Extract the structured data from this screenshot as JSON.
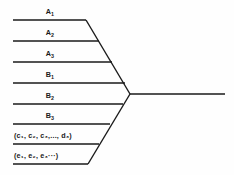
{
  "diagram": {
    "type": "fishbone-convergence",
    "background_color": "#fefefe",
    "line_color": "#1a1a1a",
    "text_color": "#1a1a1a",
    "spine": {
      "vertex_x": 130,
      "vertex_y": 94,
      "end_x": 225,
      "end_y": 94
    },
    "branches": [
      {
        "id": "a1",
        "label": "A",
        "subscript": "1",
        "full_text": "A₁",
        "line_y": 20,
        "line_x_start": 13,
        "line_x_end": 86,
        "label_x": 50,
        "label_y": 8,
        "group": "upper",
        "align": "centered"
      },
      {
        "id": "a2",
        "label": "A",
        "subscript": "2",
        "full_text": "A₂",
        "line_y": 41,
        "line_x_start": 13,
        "line_x_end": 99,
        "label_x": 50,
        "label_y": 29,
        "group": "upper",
        "align": "centered"
      },
      {
        "id": "a3",
        "label": "A",
        "subscript": "3",
        "full_text": "A₃",
        "line_y": 62,
        "line_x_start": 13,
        "line_x_end": 112,
        "label_x": 50,
        "label_y": 50,
        "group": "upper",
        "align": "centered"
      },
      {
        "id": "b1",
        "label": "B",
        "subscript": "1",
        "full_text": "B₁",
        "line_y": 83,
        "line_x_start": 13,
        "line_x_end": 125,
        "label_x": 50,
        "label_y": 71,
        "group": "upper",
        "align": "centered"
      },
      {
        "id": "b2",
        "label": "B",
        "subscript": "2",
        "full_text": "B₂",
        "line_y": 104,
        "line_x_start": 13,
        "line_x_end": 123,
        "label_x": 50,
        "label_y": 92,
        "group": "lower",
        "align": "centered"
      },
      {
        "id": "b3",
        "label": "B",
        "subscript": "3",
        "full_text": "B₃",
        "line_y": 124,
        "line_x_start": 13,
        "line_x_end": 110,
        "label_x": 50,
        "label_y": 112,
        "group": "lower",
        "align": "centered"
      },
      {
        "id": "c-group",
        "full_text": "(c₁, c₂, c₃,..., d₃)",
        "line_y": 144,
        "line_x_start": 13,
        "line_x_end": 99,
        "label_x": 14,
        "label_y": 132,
        "group": "lower",
        "align": "lefted"
      },
      {
        "id": "e-group",
        "full_text": "(e₁, e₂, e₃···)",
        "line_y": 164,
        "line_x_start": 13,
        "line_x_end": 88,
        "label_x": 14,
        "label_y": 152,
        "group": "lower",
        "align": "lefted"
      }
    ],
    "diagonals": [
      {
        "id": "upper-diagonal",
        "x1": 86,
        "y1": 20,
        "x2": 130,
        "y2": 94
      },
      {
        "id": "lower-diagonal",
        "x1": 88,
        "y1": 164,
        "x2": 130,
        "y2": 94
      }
    ]
  }
}
